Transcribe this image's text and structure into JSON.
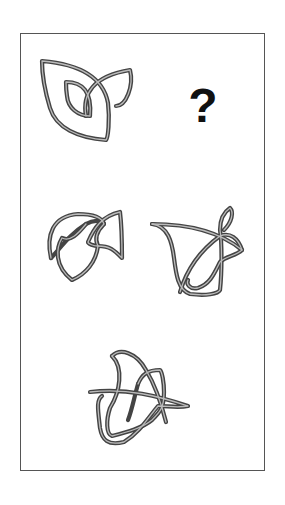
{
  "puzzle": {
    "type": "visual-analogy",
    "question_mark": "?",
    "cells": [
      {
        "id": "a",
        "position": "top-left",
        "description": "leaf shape with inner small leaf and curl"
      },
      {
        "id": "b",
        "position": "top-right",
        "description": "unknown (question mark)"
      },
      {
        "id": "c",
        "position": "middle-left",
        "description": "shield-like knot shape"
      },
      {
        "id": "d",
        "position": "middle-right",
        "description": "cup-like knot shape with loop"
      },
      {
        "id": "e",
        "position": "bottom-center",
        "description": "fin-like knot shape"
      }
    ]
  },
  "colors": {
    "stroke": "#444444",
    "frame": "#555555",
    "background": "#ffffff"
  }
}
